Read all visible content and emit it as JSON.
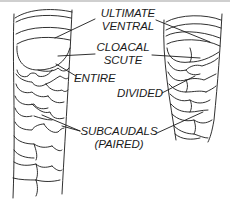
{
  "diagram": {
    "colors": {
      "line": "#1a1a1a",
      "background": "#ffffff",
      "top_border": "#cfcfcf"
    },
    "labels": {
      "ultimate_ventral_1": "ULTIMATE",
      "ultimate_ventral_2": "VENTRAL",
      "cloacal_scute_1": "CLOACAL",
      "cloacal_scute_2": "SCUTE",
      "entire": "ENTIRE",
      "divided": "DIVIDED",
      "subcaudals_1": "SUBCAUDALS",
      "subcaudals_2": "(PAIRED)"
    },
    "left_specimen": {
      "cloacal_scute": "ENTIRE"
    },
    "right_specimen": {
      "cloacal_scute": "DIVIDED"
    }
  }
}
